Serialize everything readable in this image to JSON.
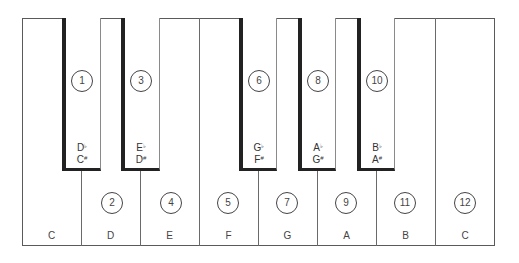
{
  "diagram": {
    "title": "",
    "keyboard": {
      "white_keys": [
        {
          "note": "C",
          "number": null
        },
        {
          "note": "D",
          "number": "2"
        },
        {
          "note": "E",
          "number": "4"
        },
        {
          "note": "F",
          "number": "5"
        },
        {
          "note": "G",
          "number": "7"
        },
        {
          "note": "A",
          "number": "9"
        },
        {
          "note": "B",
          "number": "11"
        },
        {
          "note": "C",
          "number": "12"
        }
      ],
      "black_keys": [
        {
          "number": "1",
          "flat": "D",
          "flat_sign": "♭",
          "sharp": "C",
          "sharp_sign": "#"
        },
        {
          "number": "3",
          "flat": "E",
          "flat_sign": "♭",
          "sharp": "D",
          "sharp_sign": "#"
        },
        {
          "number": "6",
          "flat": "G",
          "flat_sign": "♭",
          "sharp": "F",
          "sharp_sign": "#"
        },
        {
          "number": "8",
          "flat": "A",
          "flat_sign": "♭",
          "sharp": "G",
          "sharp_sign": "#"
        },
        {
          "number": "10",
          "flat": "B",
          "flat_sign": "♭",
          "sharp": "A",
          "sharp_sign": "#"
        }
      ]
    },
    "colors": {
      "outline": "#5a5a5a",
      "black_key_edge": "#222222",
      "text": "#3a3a3a",
      "background": "#ffffff"
    }
  }
}
